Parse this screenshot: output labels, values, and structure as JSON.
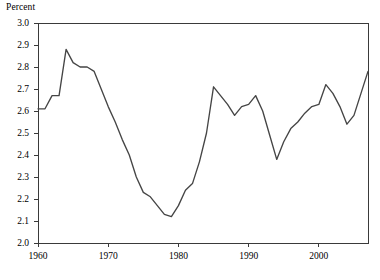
{
  "chart_data": {
    "type": "line",
    "title": "",
    "subtitle": "",
    "ylabel": "Percent",
    "xlabel": "",
    "ylim": [
      2.0,
      3.0
    ],
    "xlim": [
      1960,
      2007
    ],
    "ytick_step": 0.1,
    "grid": false,
    "legend": null,
    "legend_position": "none",
    "yticks": [
      "3.0",
      "2.9",
      "2.8",
      "2.7",
      "2.6",
      "2.5",
      "2.4",
      "2.3",
      "2.2",
      "2.1",
      "2.0"
    ],
    "xticks": [
      "1960",
      "1970",
      "1980",
      "1990",
      "2000"
    ],
    "line_color": "#454545",
    "series": [
      {
        "name": "Percent",
        "x": [
          1960,
          1961,
          1962,
          1963,
          1964,
          1965,
          1966,
          1967,
          1968,
          1969,
          1970,
          1971,
          1972,
          1973,
          1974,
          1975,
          1976,
          1977,
          1978,
          1979,
          1980,
          1981,
          1982,
          1983,
          1984,
          1985,
          1986,
          1987,
          1988,
          1989,
          1990,
          1991,
          1992,
          1993,
          1994,
          1995,
          1996,
          1997,
          1998,
          1999,
          2000,
          2001,
          2002,
          2003,
          2004,
          2005,
          2006,
          2007
        ],
        "values": [
          2.61,
          2.61,
          2.67,
          2.67,
          2.88,
          2.82,
          2.8,
          2.8,
          2.78,
          2.7,
          2.62,
          2.55,
          2.47,
          2.4,
          2.3,
          2.23,
          2.21,
          2.17,
          2.13,
          2.12,
          2.17,
          2.24,
          2.27,
          2.37,
          2.5,
          2.71,
          2.67,
          2.63,
          2.58,
          2.62,
          2.63,
          2.67,
          2.6,
          2.49,
          2.38,
          2.46,
          2.52,
          2.55,
          2.59,
          2.62,
          2.63,
          2.72,
          2.68,
          2.62,
          2.54,
          2.58,
          2.68,
          2.78
        ]
      }
    ]
  },
  "axis": {
    "y_title": "Percent"
  }
}
